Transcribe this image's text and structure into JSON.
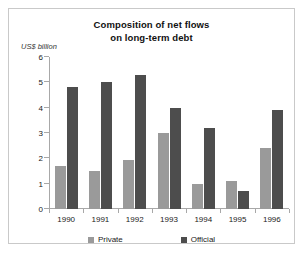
{
  "chart_data": {
    "type": "bar",
    "title": "Composition of net flows on long-term debt",
    "title_lines": [
      "Composition of net flows",
      "on long-term debt"
    ],
    "ylabel": "US$ billion",
    "xlabel": "",
    "ylim": [
      0,
      6
    ],
    "yticks": [
      0,
      1,
      2,
      3,
      4,
      5,
      6
    ],
    "ytick_labels": [
      "0",
      "1",
      "2",
      "3",
      "4",
      "5",
      "6"
    ],
    "grid": false,
    "legend_position": "bottom",
    "categories": [
      "1990",
      "1991",
      "1992",
      "1993",
      "1994",
      "1995",
      "1996"
    ],
    "series": [
      {
        "name": "Private",
        "color": "#9a9a9a",
        "values": [
          1.7,
          1.5,
          1.95,
          3.0,
          1.0,
          1.1,
          2.4
        ]
      },
      {
        "name": "Official",
        "color": "#4d4d4d",
        "values": [
          4.8,
          5.0,
          5.3,
          4.0,
          3.2,
          0.7,
          3.9
        ]
      }
    ]
  },
  "colors": {
    "private": "#9a9a9a",
    "official": "#4d4d4d",
    "axis": "#a8a8a8",
    "border": "#c9c9c9",
    "text": "#222222"
  }
}
